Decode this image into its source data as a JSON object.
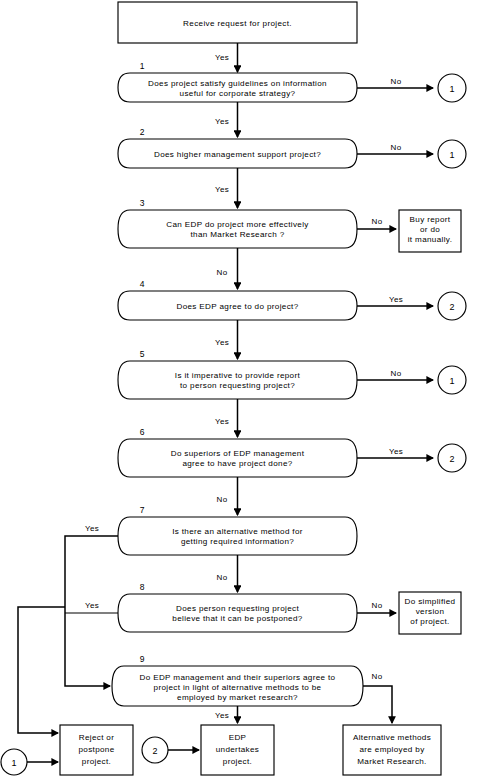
{
  "diagram": {
    "colors": {
      "stroke": "#000000",
      "fill": "#ffffff",
      "text": "#000000"
    }
  },
  "start": {
    "id": "start",
    "text": "Receive request for project."
  },
  "decisions": [
    {
      "number": "1",
      "line1": "Does project satisfy guidelines on information",
      "line2": "useful for corporate strategy?",
      "line3": "",
      "yes_label": "Yes",
      "no_label": "No"
    },
    {
      "number": "2",
      "line1": "Does higher management support project?",
      "line2": "",
      "line3": "",
      "yes_label": "Yes",
      "no_label": "No"
    },
    {
      "number": "3",
      "line1": "Can EDP do project more effectively",
      "line2": "than Market Research ?",
      "line3": "",
      "yes_label": "No",
      "no_label": "No"
    },
    {
      "number": "4",
      "line1": "Does EDP agree to do project?",
      "line2": "",
      "line3": "",
      "yes_label": "Yes",
      "no_label": "Yes"
    },
    {
      "number": "5",
      "line1": "Is it imperative to provide report",
      "line2": "to person requesting project?",
      "line3": "",
      "yes_label": "Yes",
      "no_label": "No"
    },
    {
      "number": "6",
      "line1": "Do superiors of EDP management",
      "line2": "agree to have project done?",
      "line3": "",
      "yes_label": "Yes",
      "no_label": "No"
    },
    {
      "number": "7",
      "line1": "Is there an alternative method for",
      "line2": "getting required information?",
      "line3": "",
      "yes_label": "Yes",
      "no_label": "No"
    },
    {
      "number": "8",
      "line1": "Does person requesting project",
      "line2": "believe that it can be postponed?",
      "line3": "",
      "yes_label": "Yes",
      "no_label": "No"
    },
    {
      "number": "9",
      "line1": "Do EDP management and their superiors agree to",
      "line2": "project in light of alternative methods to be",
      "line3": "employed by market research?",
      "yes_label": "Yes",
      "no_label": "No"
    }
  ],
  "edge_labels": {
    "start_to_d1": "Yes",
    "d1_to_d2": "Yes",
    "d1_no": "No",
    "d2_to_d3": "Yes",
    "d2_no": "No",
    "d3_to_d4": "No",
    "d3_no": "No",
    "d4_to_d5": "Yes",
    "d4_yes": "Yes",
    "d5_to_d6": "Yes",
    "d5_no": "No",
    "d6_to_d7": "No",
    "d6_yes": "Yes",
    "d7_to_d8": "No",
    "d7_yes": "Yes",
    "d8_no": "No",
    "d8_yes": "Yes",
    "d9_to_edp": "Yes",
    "d9_no": "No"
  },
  "terminals": [
    {
      "id": "buy-report",
      "line1": "Buy report",
      "line2": "or do",
      "line3": "it manually."
    },
    {
      "id": "do-simplified",
      "line1": "Do simplified",
      "line2": "version",
      "line3": "of project."
    },
    {
      "id": "reject-postpone",
      "line1": "Reject or",
      "line2": "postpone",
      "line3": "project."
    },
    {
      "id": "edp-undertakes",
      "line1": "EDP",
      "line2": "undertakes",
      "line3": "project."
    },
    {
      "id": "alternative-methods",
      "line1": "Alternative methods",
      "line2": "are employed by",
      "line3": "Market Research."
    }
  ],
  "connectors": [
    {
      "id": "conn-1-a",
      "label": "1"
    },
    {
      "id": "conn-1-b",
      "label": "1"
    },
    {
      "id": "conn-1-c",
      "label": "1"
    },
    {
      "id": "conn-2-a",
      "label": "2"
    },
    {
      "id": "conn-2-b",
      "label": "2"
    },
    {
      "id": "conn-1-bottom",
      "label": "1"
    },
    {
      "id": "conn-2-bottom",
      "label": "2"
    }
  ]
}
